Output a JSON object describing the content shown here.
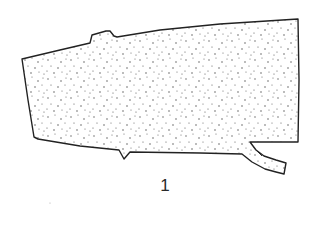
{
  "figure": {
    "label": "1",
    "stroke_color": "#222222",
    "fill_color": "#ffffff",
    "stipple_color": "#444444",
    "outline_points": [
      [
        22,
        59
      ],
      [
        90,
        43
      ],
      [
        93,
        34
      ],
      [
        106,
        31
      ],
      [
        113,
        35
      ],
      [
        117,
        37
      ],
      [
        298,
        19
      ],
      [
        298,
        142
      ],
      [
        250,
        142
      ],
      [
        262,
        156
      ],
      [
        286,
        163
      ],
      [
        283,
        174
      ],
      [
        270,
        171
      ],
      [
        242,
        154
      ],
      [
        130,
        152
      ],
      [
        124,
        159
      ],
      [
        119,
        150
      ],
      [
        38,
        139
      ],
      [
        34,
        137
      ]
    ]
  }
}
